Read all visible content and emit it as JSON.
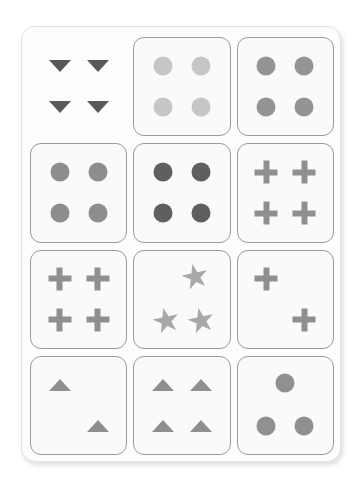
{
  "page": {
    "background": "#ffffff",
    "panel": {
      "background": "#fdfdfd",
      "border_color": "#e2e2e2",
      "corner_radius_px": 14
    }
  },
  "palette": {
    "ink_light": "#c9c9c9",
    "ink_medium": "#9e9e9e",
    "ink_mid_gray": "#8a8a8a",
    "ink_dark": "#6b6b6b",
    "ink_darkest": "#555555",
    "card_fill": "#fafafa",
    "card_border": "#9a9a9a"
  },
  "grid": {
    "rows": 4,
    "columns": 3,
    "cells": [
      {
        "id": "r1c1",
        "framed": false,
        "shape": "triangle-down",
        "count": 4,
        "color": "#585858",
        "positions": [
          "top-left",
          "top-right",
          "bottom-left",
          "bottom-right"
        ]
      },
      {
        "id": "r1c2",
        "framed": true,
        "shape": "circle",
        "count": 4,
        "color": "#c6c6c6",
        "positions": [
          "top-left",
          "top-right",
          "bottom-left",
          "bottom-right"
        ]
      },
      {
        "id": "r1c3",
        "framed": true,
        "shape": "circle",
        "count": 4,
        "color": "#949494",
        "positions": [
          "top-left",
          "top-right",
          "bottom-left",
          "bottom-right"
        ]
      },
      {
        "id": "r2c1",
        "framed": true,
        "shape": "circle",
        "count": 4,
        "color": "#8d8d8d",
        "positions": [
          "top-left",
          "top-right",
          "bottom-left",
          "bottom-right"
        ]
      },
      {
        "id": "r2c2",
        "framed": true,
        "shape": "circle",
        "count": 4,
        "color": "#5f5f5f",
        "positions": [
          "top-left",
          "top-right",
          "bottom-left",
          "bottom-right"
        ]
      },
      {
        "id": "r2c3",
        "framed": true,
        "shape": "plus",
        "count": 4,
        "color": "#8f8f8f",
        "positions": [
          "top-left",
          "top-right",
          "bottom-left",
          "bottom-right"
        ]
      },
      {
        "id": "r3c1",
        "framed": true,
        "shape": "plus",
        "count": 4,
        "color": "#8f8f8f",
        "positions": [
          "top-left",
          "top-right",
          "bottom-left",
          "bottom-right"
        ]
      },
      {
        "id": "r3c2",
        "framed": true,
        "shape": "star",
        "count": 3,
        "color": "#a8a8a8",
        "positions": [
          "top-center-right",
          "bottom-left-star",
          "bottom-right-star"
        ]
      },
      {
        "id": "r3c3",
        "framed": true,
        "shape": "plus",
        "count": 2,
        "color": "#8f8f8f",
        "positions": [
          "top-left",
          "bottom-right"
        ]
      },
      {
        "id": "r4c1",
        "framed": true,
        "shape": "triangle-up",
        "count": 2,
        "color": "#8f8f8f",
        "positions": [
          "top-left",
          "bottom-right"
        ]
      },
      {
        "id": "r4c2",
        "framed": true,
        "shape": "triangle-up",
        "count": 4,
        "color": "#8f8f8f",
        "positions": [
          "top-left",
          "top-right",
          "bottom-left",
          "bottom-right"
        ]
      },
      {
        "id": "r4c3",
        "framed": true,
        "shape": "circle",
        "count": 3,
        "color": "#909090",
        "positions": [
          "top-center",
          "bottom-left",
          "bottom-right"
        ]
      }
    ]
  }
}
